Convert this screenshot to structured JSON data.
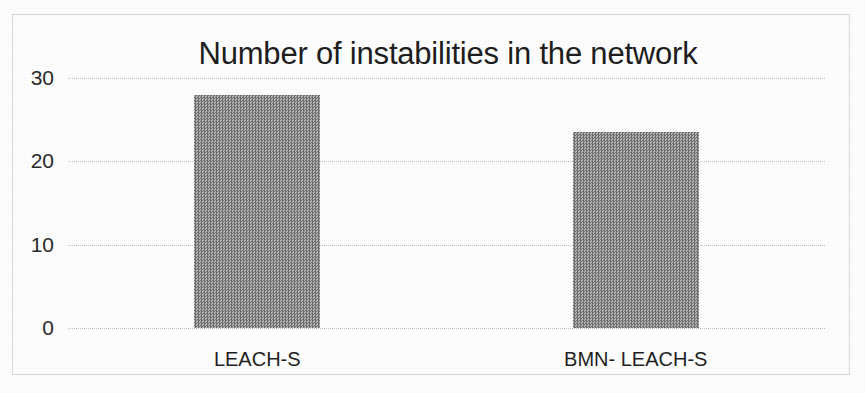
{
  "chart_data": {
    "type": "bar",
    "title": "Number of instabilities in the network",
    "xlabel": "",
    "ylabel": "",
    "categories": [
      "LEACH-S",
      "BMN- LEACH-S"
    ],
    "values": [
      28,
      23.5
    ],
    "series": [
      {
        "name": "Number of instabilities",
        "values": [
          28,
          23.5
        ]
      }
    ],
    "ylim": [
      0,
      30
    ],
    "yticks": [
      0,
      10,
      20,
      30
    ],
    "ytick_labels": [
      "0",
      "10",
      "20",
      "30"
    ],
    "grid": true,
    "legend": false,
    "legend_position": "none",
    "bar_color": "#8d8d8d",
    "gridline_color": "#c3c3c3",
    "frame_color": "#d8d8d8",
    "background_color": "#fdfdfd",
    "text_color": "#1d1d1d"
  }
}
